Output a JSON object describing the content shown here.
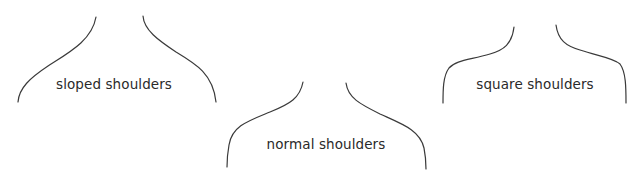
{
  "figure": {
    "panels": [
      {
        "id": "sloped",
        "label": "sloped shoulders",
        "label_pos": {
          "x": 114,
          "y": 84
        },
        "left_path": "M 96 17 C 92 40, 70 52, 48 66 C 30 78, 19 88, 18 102",
        "right_path": "M 143 16 C 144 30, 158 40, 176 52 C 196 64, 213 74, 216 102"
      },
      {
        "id": "normal",
        "label": "normal shoulders",
        "label_pos": {
          "x": 326,
          "y": 144
        },
        "left_path": "M 303 82 C 300 98, 290 104, 270 112 C 248 121, 232 126, 229 145 C 227 156, 227 162, 227 167",
        "right_path": "M 346 83 C 348 98, 360 104, 380 114 C 402 124, 420 130, 424 148 C 426 158, 426 164, 426 169"
      },
      {
        "id": "square",
        "label": "square shoulders",
        "label_pos": {
          "x": 535,
          "y": 84
        },
        "left_path": "M 514 27 C 512 44, 504 50, 490 54 C 470 60, 456 60, 449 68 C 443 76, 443 90, 443 103",
        "right_path": "M 556 25 C 558 40, 566 46, 580 50 C 598 56, 614 58, 620 64 C 626 72, 626 88, 626 103"
      }
    ],
    "stroke_color": "#3a3a3a",
    "background": "#ffffff"
  }
}
